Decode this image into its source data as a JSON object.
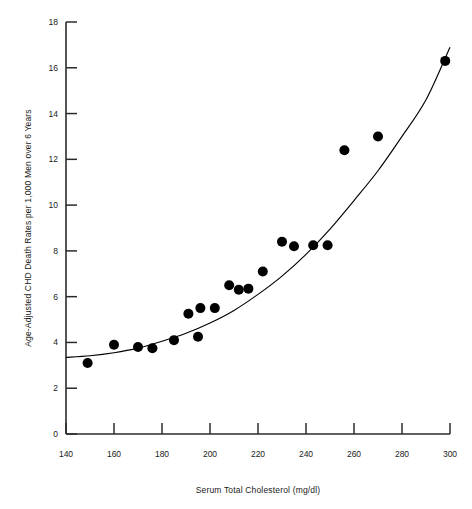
{
  "chart_data": {
    "type": "scatter",
    "title": "",
    "xlabel": "Serum Total Cholesterol (mg/dl)",
    "ylabel": "Age-Adjusted CHD Death Rates per 1,000 Men over 6 Years",
    "xlim": [
      140,
      300
    ],
    "ylim": [
      0,
      18
    ],
    "xticks": [
      140,
      160,
      180,
      200,
      220,
      240,
      260,
      280,
      300
    ],
    "yticks": [
      0,
      2,
      4,
      6,
      8,
      10,
      12,
      14,
      16,
      18
    ],
    "grid": false,
    "legend": null,
    "marker": {
      "shape": "circle",
      "color": "#000000",
      "size": 10
    },
    "points": [
      {
        "x": 149,
        "y": 3.1
      },
      {
        "x": 160,
        "y": 3.9
      },
      {
        "x": 170,
        "y": 3.8
      },
      {
        "x": 176,
        "y": 3.75
      },
      {
        "x": 185,
        "y": 4.1
      },
      {
        "x": 191,
        "y": 5.25
      },
      {
        "x": 195,
        "y": 4.25
      },
      {
        "x": 196,
        "y": 5.5
      },
      {
        "x": 202,
        "y": 5.5
      },
      {
        "x": 208,
        "y": 6.5
      },
      {
        "x": 212,
        "y": 6.3
      },
      {
        "x": 216,
        "y": 6.35
      },
      {
        "x": 222,
        "y": 7.1
      },
      {
        "x": 230,
        "y": 8.4
      },
      {
        "x": 235,
        "y": 8.2
      },
      {
        "x": 243,
        "y": 8.25
      },
      {
        "x": 249,
        "y": 8.25
      },
      {
        "x": 256,
        "y": 12.4
      },
      {
        "x": 270,
        "y": 13.0
      },
      {
        "x": 298,
        "y": 16.3
      }
    ],
    "fit_curve": {
      "name": "fitted-trend-curve",
      "color": "#000000",
      "points": [
        {
          "x": 140,
          "y": 3.35
        },
        {
          "x": 150,
          "y": 3.42
        },
        {
          "x": 160,
          "y": 3.55
        },
        {
          "x": 170,
          "y": 3.75
        },
        {
          "x": 180,
          "y": 4.05
        },
        {
          "x": 190,
          "y": 4.4
        },
        {
          "x": 200,
          "y": 4.85
        },
        {
          "x": 210,
          "y": 5.4
        },
        {
          "x": 220,
          "y": 6.1
        },
        {
          "x": 230,
          "y": 6.9
        },
        {
          "x": 240,
          "y": 7.85
        },
        {
          "x": 250,
          "y": 8.95
        },
        {
          "x": 260,
          "y": 10.2
        },
        {
          "x": 270,
          "y": 11.5
        },
        {
          "x": 280,
          "y": 13.0
        },
        {
          "x": 290,
          "y": 14.6
        },
        {
          "x": 300,
          "y": 16.9
        }
      ]
    }
  },
  "axis": {
    "x_tick_labels": [
      "140",
      "160",
      "180",
      "200",
      "220",
      "240",
      "260",
      "280",
      "300"
    ],
    "y_tick_labels": [
      "0",
      "2",
      "4",
      "6",
      "8",
      "10",
      "12",
      "14",
      "16",
      "18"
    ],
    "x_title": "Serum Total Cholesterol (mg/dl)",
    "y_title": "Age-Adjusted CHD Death Rates per 1,000 Men over 6 Years"
  }
}
